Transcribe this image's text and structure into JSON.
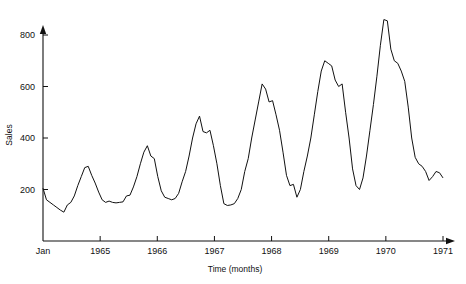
{
  "chart_data": {
    "type": "line",
    "title": "",
    "subtitle": "",
    "xlabel": "Time (months)",
    "ylabel": "Sales",
    "grid": false,
    "legend": null,
    "xlim": [
      0,
      84
    ],
    "ylim": [
      0,
      800
    ],
    "y_ticks": [
      200,
      400,
      600,
      800
    ],
    "y_tick_labels": [
      "200",
      "400",
      "600",
      "800"
    ],
    "x_ticks": [
      0,
      12,
      24,
      36,
      48,
      60,
      72,
      84
    ],
    "x_tick_labels": [
      "Jan",
      "1965",
      "1966",
      "1967",
      "1968",
      "1969",
      "1970",
      "1971"
    ],
    "x_origin_label": "Jan",
    "axis_arrows": true,
    "line_color": "#111111",
    "line_width": 1,
    "x_unit": "months",
    "x_start": "Jan 1965",
    "x_end": "Dec 1970",
    "series": [
      {
        "name": "Sales",
        "x": [
          0,
          1,
          2,
          3,
          4,
          5,
          6,
          7,
          8,
          9,
          10,
          11,
          12,
          13,
          14,
          15,
          16,
          17,
          18,
          19,
          20,
          21,
          22,
          23,
          24,
          25,
          26,
          27,
          28,
          29,
          30,
          31,
          32,
          33,
          34,
          35,
          36,
          37,
          38,
          39,
          40,
          41,
          42,
          43,
          44,
          45,
          46,
          47,
          48,
          49,
          50,
          51,
          52,
          53,
          54,
          55,
          56,
          57,
          58,
          59,
          60,
          61,
          62,
          63,
          64,
          65,
          66,
          67,
          68,
          69,
          70,
          71,
          72,
          73,
          74,
          75,
          76,
          77,
          78,
          79,
          80,
          81,
          82,
          83
        ],
        "values": [
          205,
          160,
          150,
          140,
          130,
          120,
          112,
          140,
          150,
          175,
          215,
          250,
          285,
          290,
          255,
          225,
          190,
          160,
          150,
          155,
          150,
          148,
          150,
          152,
          175,
          178,
          210,
          250,
          300,
          345,
          370,
          330,
          320,
          250,
          195,
          170,
          165,
          160,
          165,
          185,
          230,
          270,
          330,
          400,
          455,
          485,
          425,
          420,
          430,
          370,
          300,
          215,
          145,
          138,
          140,
          145,
          165,
          200,
          270,
          320,
          400,
          470,
          540,
          610,
          590,
          540,
          545,
          490,
          430,
          345,
          255,
          215,
          220,
          170,
          200,
          270,
          330,
          400,
          490,
          580,
          660,
          700,
          690,
          680
        ],
        "values_continued": [
          625,
          600,
          610,
          500,
          400,
          280,
          215,
          200,
          245,
          330,
          430,
          530,
          640,
          760,
          860,
          855,
          745,
          700,
          690,
          660,
          620,
          520,
          400,
          325,
          300,
          290,
          270,
          235,
          250,
          270,
          265,
          245
        ]
      }
    ],
    "peaks": [
      {
        "label": "1965 peak",
        "value": 292
      },
      {
        "label": "1966 peak",
        "value": 372
      },
      {
        "label": "1967 peak",
        "value": 487
      },
      {
        "label": "1968 peak",
        "value": 615
      },
      {
        "label": "1969 peak",
        "value": 702
      },
      {
        "label": "1970 peak",
        "value": 862
      }
    ],
    "troughs": [
      {
        "label": "1965 trough",
        "value": 118
      },
      {
        "label": "1966 trough",
        "value": 148
      },
      {
        "label": "1967 trough",
        "value": 160
      },
      {
        "label": "1968 trough",
        "value": 137
      },
      {
        "label": "1969 trough",
        "value": 167
      },
      {
        "label": "1970 trough",
        "value": 196
      }
    ]
  }
}
